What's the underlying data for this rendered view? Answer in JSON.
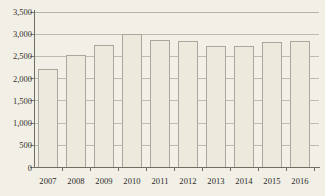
{
  "chart_data": {
    "type": "bar",
    "title": "",
    "xlabel": "",
    "ylabel": "",
    "categories": [
      "2007",
      "2008",
      "2009",
      "2010",
      "2011",
      "2012",
      "2013",
      "2014",
      "2015",
      "2016"
    ],
    "values": [
      2230,
      2540,
      2770,
      3010,
      2880,
      2850,
      2730,
      2730,
      2820,
      2860
    ],
    "ylim": [
      0,
      3500
    ],
    "yticks": [
      0,
      500,
      1000,
      1500,
      2000,
      2500,
      3000,
      3500
    ],
    "ytick_labels": [
      "0",
      "500",
      "1,000",
      "1,500",
      "2,000",
      "2,500",
      "3,000",
      "3,500"
    ],
    "grid": true,
    "legend": "none",
    "colors": {
      "background": "#f2efe6",
      "bar_fill": "#edeadd",
      "bar_border": "#a9a79d",
      "gridline": "#bdbcb4",
      "axis": "#6f6d66",
      "text": "#2b2b28"
    }
  }
}
